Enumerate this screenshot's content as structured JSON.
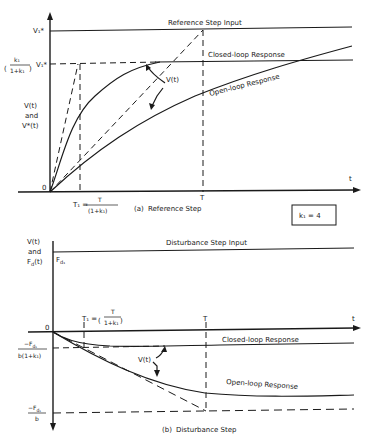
{
  "panel_a": {
    "caption_letter": "(a)",
    "caption": "Reference Step",
    "y_axis_label_1": "V(t)",
    "y_axis_label_2": "and",
    "y_axis_label_3": "V*(t)",
    "origin": "0",
    "x_axis_var": "t",
    "y_tick_top": "V₁*",
    "y_tick_mid_num": "k₁",
    "y_tick_mid_den": "1+k₁",
    "y_tick_mid_suffix": "V₁*",
    "x_tick_T1_left": "T₁ =",
    "x_tick_T1_num": "T",
    "x_tick_T1_den": "(1+k₁)",
    "x_tick_T": "T",
    "curve_reference": "Reference Step Input",
    "curve_closed": "Closed-loop Response",
    "curve_open": "Open-loop Response",
    "curve_annotation": "V(t)",
    "gain_box": "k₁ = 4"
  },
  "panel_b": {
    "caption_letter": "(b)",
    "caption": "Disturbance Step",
    "y_axis_label_1": "V(t)",
    "y_axis_label_2": "and",
    "y_axis_label_3": "F",
    "y_axis_label_3_sub": "d",
    "y_axis_label_3_tail": "(t)",
    "origin": "0",
    "x_axis_var": "t",
    "y_tick_top": "F",
    "y_tick_top_sub": "d₁",
    "y_tick_mid_num": "−F",
    "y_tick_mid_num_sub": "d₁",
    "y_tick_mid_den": "b(1+k₁)",
    "y_tick_low_num": "−F",
    "y_tick_low_num_sub": "d₁",
    "y_tick_low_den": "b",
    "x_tick_T1_left": "T₁ =",
    "x_tick_T1_num": "T",
    "x_tick_T1_den": "1+k₁",
    "x_tick_T": "T",
    "curve_disturbance": "Disturbance Step Input",
    "curve_closed": "Closed-loop Response",
    "curve_open": "Open-loop Response",
    "curve_annotation": "V(t)"
  }
}
